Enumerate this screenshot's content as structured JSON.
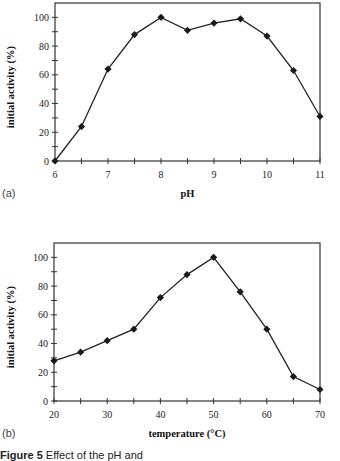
{
  "chart_data": [
    {
      "type": "line",
      "panel_label": "(a)",
      "title": "",
      "xlabel": "pH",
      "ylabel": "initial activity (%)",
      "x": [
        6,
        6.5,
        7,
        7.5,
        8,
        8.5,
        9,
        9.5,
        10,
        10.5,
        11
      ],
      "series": [
        {
          "name": "activity",
          "values": [
            0,
            24,
            64,
            88,
            100,
            91,
            96,
            99,
            87,
            63,
            31
          ]
        }
      ],
      "xticks": [
        "6",
        "7",
        "8",
        "9",
        "10",
        "11"
      ],
      "yticks": [
        "0",
        "20",
        "40",
        "60",
        "80",
        "100"
      ],
      "xlim": [
        6,
        11
      ],
      "ylim": [
        0,
        110
      ],
      "grid": false,
      "marker": "diamond",
      "frame": {
        "x0": 55,
        "x1": 320,
        "y0": 3,
        "y1": 161
      }
    },
    {
      "type": "line",
      "panel_label": "(b)",
      "title": "",
      "xlabel": "temperature (°C)",
      "ylabel": "initial activity (%)",
      "x": [
        20,
        25,
        30,
        35,
        40,
        45,
        50,
        55,
        60,
        65,
        70
      ],
      "series": [
        {
          "name": "activity",
          "values": [
            28,
            34,
            42,
            50,
            72,
            88,
            100,
            76,
            50,
            17,
            8
          ]
        }
      ],
      "xticks": [
        "20",
        "30",
        "40",
        "50",
        "60",
        "70"
      ],
      "yticks": [
        "0",
        "20",
        "40",
        "60",
        "80",
        "100"
      ],
      "xlim": [
        20,
        70
      ],
      "ylim": [
        0,
        110
      ],
      "grid": false,
      "marker": "diamond",
      "frame": {
        "x0": 54,
        "x1": 320,
        "y0": 243,
        "y1": 401
      }
    }
  ],
  "caption": {
    "label": "Figure 5",
    "text": "Effect of the pH and"
  }
}
